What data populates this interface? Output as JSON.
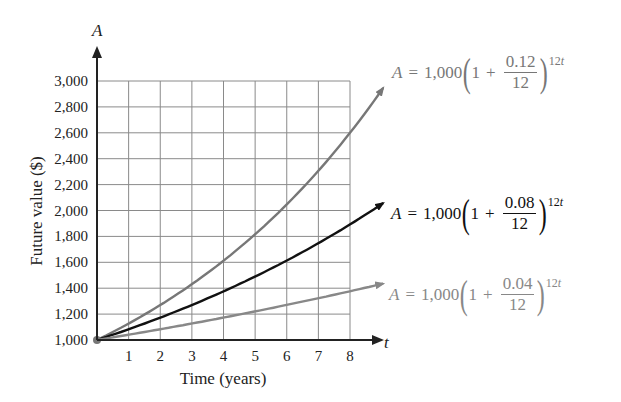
{
  "chart_data": {
    "type": "line",
    "title": "",
    "xlabel": "Time (years)",
    "ylabel": "Future value ($)",
    "x_axis_var": "t",
    "y_axis_var": "A",
    "xlim": [
      0,
      8
    ],
    "ylim": [
      1000,
      3000
    ],
    "x_ticks": [
      "1",
      "2",
      "3",
      "4",
      "5",
      "6",
      "7",
      "8"
    ],
    "y_ticks": [
      "1,000",
      "1,200",
      "1,400",
      "1,600",
      "1,800",
      "2,000",
      "2,200",
      "2,400",
      "2,600",
      "2,800",
      "3,000"
    ],
    "grid": true,
    "x": [
      0,
      1,
      2,
      3,
      4,
      5,
      6,
      7,
      8
    ],
    "series": [
      {
        "name": "A = 1,000(1 + 0.12/12)^12t",
        "rate": 0.12,
        "color": "#777777",
        "values": [
          1000,
          1127,
          1270,
          1431,
          1612,
          1817,
          2047,
          2307,
          2599
        ]
      },
      {
        "name": "A = 1,000(1 + 0.08/12)^12t",
        "rate": 0.08,
        "color": "#111111",
        "values": [
          1000,
          1083,
          1173,
          1270,
          1376,
          1490,
          1614,
          1748,
          1893
        ]
      },
      {
        "name": "A = 1,000(1 + 0.04/12)^12t",
        "rate": 0.04,
        "color": "#888888",
        "values": [
          1000,
          1041,
          1083,
          1127,
          1173,
          1221,
          1271,
          1323,
          1376
        ]
      }
    ]
  },
  "equations": [
    {
      "lhs": "A",
      "eq": "=",
      "principal": "1,000",
      "one": "1",
      "plus": "+",
      "num": "0.12",
      "den": "12",
      "exp_num": "12",
      "exp_var": "t",
      "color": "#777777"
    },
    {
      "lhs": "A",
      "eq": "=",
      "principal": "1,000",
      "one": "1",
      "plus": "+",
      "num": "0.08",
      "den": "12",
      "exp_num": "12",
      "exp_var": "t",
      "color": "#111111"
    },
    {
      "lhs": "A",
      "eq": "=",
      "principal": "1,000",
      "one": "1",
      "plus": "+",
      "num": "0.04",
      "den": "12",
      "exp_num": "12",
      "exp_var": "t",
      "color": "#888888"
    }
  ]
}
